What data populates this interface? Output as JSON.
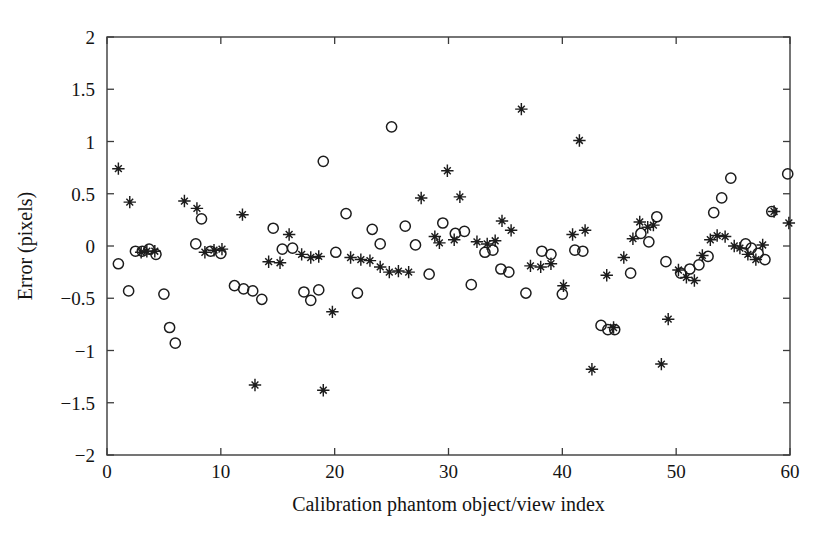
{
  "figure": {
    "background_color": "#ffffff",
    "marker_color": "#1c1c1c",
    "axis_color": "#3b3b3b"
  },
  "chart_data": {
    "type": "scatter",
    "title": "",
    "xlabel": "Calibration phantom object/view index",
    "ylabel": "Error (pixels)",
    "xlim": [
      0,
      60
    ],
    "ylim": [
      -2,
      2
    ],
    "xticks": [
      0,
      10,
      20,
      30,
      40,
      50,
      60
    ],
    "xtick_labels": [
      "0",
      "10",
      "20",
      "30",
      "40",
      "50",
      "60"
    ],
    "yticks": [
      -2,
      -1.5,
      -1,
      -0.5,
      0,
      0.5,
      1,
      1.5,
      2
    ],
    "ytick_labels": [
      "−2",
      "−1.5",
      "−1",
      "−0.5",
      "0",
      "0.5",
      "1",
      "1.5",
      "2"
    ],
    "grid": false,
    "legend": "none",
    "series": [
      {
        "name": "circle-series",
        "marker": "circle",
        "points": [
          [
            1.0,
            -0.17
          ],
          [
            1.9,
            -0.43
          ],
          [
            2.5,
            -0.05
          ],
          [
            3.1,
            -0.05
          ],
          [
            3.7,
            -0.03
          ],
          [
            4.3,
            -0.08
          ],
          [
            5.0,
            -0.46
          ],
          [
            5.5,
            -0.78
          ],
          [
            6.0,
            -0.93
          ],
          [
            7.8,
            0.02
          ],
          [
            8.3,
            0.26
          ],
          [
            9.1,
            -0.05
          ],
          [
            10.0,
            -0.07
          ],
          [
            11.2,
            -0.38
          ],
          [
            12.0,
            -0.41
          ],
          [
            12.8,
            -0.43
          ],
          [
            13.6,
            -0.51
          ],
          [
            14.6,
            0.17
          ],
          [
            15.4,
            -0.03
          ],
          [
            16.3,
            -0.02
          ],
          [
            17.3,
            -0.44
          ],
          [
            17.9,
            -0.52
          ],
          [
            18.6,
            -0.42
          ],
          [
            19.0,
            0.81
          ],
          [
            20.1,
            -0.06
          ],
          [
            21.0,
            0.31
          ],
          [
            22.0,
            -0.45
          ],
          [
            23.3,
            0.16
          ],
          [
            24.0,
            0.02
          ],
          [
            25.0,
            1.14
          ],
          [
            26.2,
            0.19
          ],
          [
            27.1,
            0.01
          ],
          [
            28.3,
            -0.27
          ],
          [
            29.5,
            0.22
          ],
          [
            30.6,
            0.12
          ],
          [
            31.4,
            0.14
          ],
          [
            32.0,
            -0.37
          ],
          [
            33.2,
            -0.06
          ],
          [
            33.9,
            -0.04
          ],
          [
            34.6,
            -0.22
          ],
          [
            35.3,
            -0.25
          ],
          [
            36.8,
            -0.45
          ],
          [
            38.2,
            -0.05
          ],
          [
            39.0,
            -0.08
          ],
          [
            40.0,
            -0.46
          ],
          [
            41.1,
            -0.04
          ],
          [
            41.8,
            -0.05
          ],
          [
            43.4,
            -0.76
          ],
          [
            44.0,
            -0.8
          ],
          [
            44.6,
            -0.8
          ],
          [
            46.0,
            -0.26
          ],
          [
            46.9,
            0.12
          ],
          [
            47.6,
            0.04
          ],
          [
            48.3,
            0.28
          ],
          [
            49.1,
            -0.15
          ],
          [
            50.4,
            -0.26
          ],
          [
            51.2,
            -0.22
          ],
          [
            52.0,
            -0.18
          ],
          [
            52.8,
            -0.1
          ],
          [
            53.3,
            0.32
          ],
          [
            54.0,
            0.46
          ],
          [
            54.8,
            0.65
          ],
          [
            56.1,
            0.02
          ],
          [
            56.6,
            -0.02
          ],
          [
            57.2,
            -0.07
          ],
          [
            57.8,
            -0.13
          ],
          [
            58.4,
            0.33
          ],
          [
            59.8,
            0.69
          ]
        ]
      },
      {
        "name": "star-series",
        "marker": "star",
        "points": [
          [
            1.0,
            0.74
          ],
          [
            2.0,
            0.42
          ],
          [
            3.0,
            -0.06
          ],
          [
            3.5,
            -0.05
          ],
          [
            4.2,
            -0.05
          ],
          [
            6.8,
            0.43
          ],
          [
            7.9,
            0.36
          ],
          [
            8.6,
            -0.06
          ],
          [
            9.4,
            -0.04
          ],
          [
            10.1,
            -0.03
          ],
          [
            11.9,
            0.3
          ],
          [
            13.0,
            -1.33
          ],
          [
            14.2,
            -0.15
          ],
          [
            15.2,
            -0.16
          ],
          [
            16.0,
            0.11
          ],
          [
            17.1,
            -0.08
          ],
          [
            17.9,
            -0.11
          ],
          [
            18.6,
            -0.1
          ],
          [
            19.0,
            -1.38
          ],
          [
            19.8,
            -0.63
          ],
          [
            21.4,
            -0.11
          ],
          [
            22.3,
            -0.13
          ],
          [
            23.1,
            -0.14
          ],
          [
            24.0,
            -0.2
          ],
          [
            24.8,
            -0.25
          ],
          [
            25.6,
            -0.24
          ],
          [
            26.5,
            -0.25
          ],
          [
            27.6,
            0.46
          ],
          [
            28.8,
            0.09
          ],
          [
            29.2,
            0.03
          ],
          [
            29.9,
            0.72
          ],
          [
            30.5,
            0.06
          ],
          [
            31.0,
            0.47
          ],
          [
            32.5,
            0.04
          ],
          [
            33.4,
            0.02
          ],
          [
            34.1,
            0.05
          ],
          [
            34.7,
            0.24
          ],
          [
            35.5,
            0.15
          ],
          [
            36.4,
            1.31
          ],
          [
            37.2,
            -0.19
          ],
          [
            38.1,
            -0.2
          ],
          [
            39.0,
            -0.17
          ],
          [
            40.1,
            -0.38
          ],
          [
            40.9,
            0.11
          ],
          [
            41.5,
            1.01
          ],
          [
            42.0,
            0.15
          ],
          [
            42.6,
            -1.18
          ],
          [
            43.9,
            -0.28
          ],
          [
            44.5,
            -0.78
          ],
          [
            45.4,
            -0.11
          ],
          [
            46.2,
            0.07
          ],
          [
            46.8,
            0.23
          ],
          [
            47.5,
            0.18
          ],
          [
            48.0,
            0.2
          ],
          [
            48.7,
            -1.13
          ],
          [
            49.3,
            -0.7
          ],
          [
            50.2,
            -0.23
          ],
          [
            50.9,
            -0.3
          ],
          [
            51.6,
            -0.33
          ],
          [
            52.3,
            -0.09
          ],
          [
            53.0,
            0.06
          ],
          [
            53.6,
            0.1
          ],
          [
            54.3,
            0.09
          ],
          [
            55.1,
            0.0
          ],
          [
            55.6,
            -0.02
          ],
          [
            56.3,
            -0.08
          ],
          [
            57.0,
            -0.13
          ],
          [
            57.6,
            0.01
          ],
          [
            58.6,
            0.33
          ],
          [
            59.9,
            0.22
          ]
        ]
      }
    ]
  }
}
